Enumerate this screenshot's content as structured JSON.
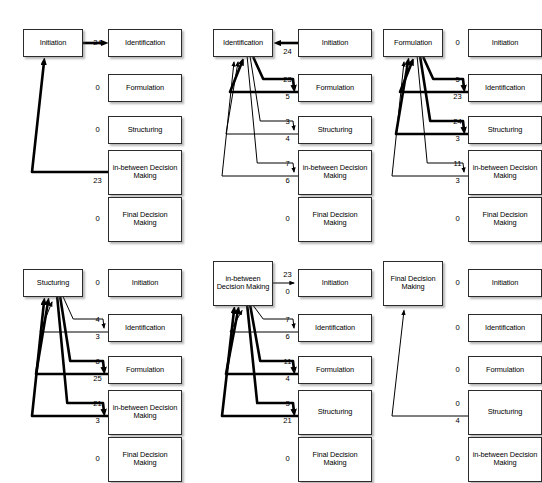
{
  "diagram": {
    "phase_labels": {
      "initiation": "Initiation",
      "identification": "Identification",
      "formulation": "Formulation",
      "structuring": "Structuring",
      "structuring_typo": "Stucturing",
      "inbetween": "in-between Decision Making",
      "final": "Final Decision Making"
    }
  },
  "panels": [
    {
      "id": "panel-initiation",
      "source": "Initiation",
      "rows": [
        {
          "target": "Identification",
          "out": "24",
          "in": null,
          "dir": "out",
          "weight": "thick"
        },
        {
          "target": "Formulation",
          "out": "0",
          "in": null,
          "dir": "none",
          "weight": "none"
        },
        {
          "target": "Structuring",
          "out": "0",
          "in": null,
          "dir": "none",
          "weight": "none"
        },
        {
          "target": "in-between Decision Making",
          "out": null,
          "in": "23",
          "dir": "in",
          "weight": "thick"
        },
        {
          "target": "Final Decision Making",
          "out": "0",
          "in": null,
          "dir": "none",
          "weight": "none"
        }
      ]
    },
    {
      "id": "panel-identification",
      "source": "Identification",
      "rows": [
        {
          "target": "Initiation",
          "out": null,
          "in": "24",
          "dir": "in",
          "weight": "thick"
        },
        {
          "target": "Formulation",
          "out": "23",
          "in": "5",
          "dir": "both",
          "weight": "thick"
        },
        {
          "target": "Structuring",
          "out": "3",
          "in": "4",
          "dir": "both",
          "weight": "thin"
        },
        {
          "target": "in-between Decision Making",
          "out": "7",
          "in": "6",
          "dir": "both",
          "weight": "thin"
        },
        {
          "target": "Final Decision Making",
          "out": "0",
          "in": null,
          "dir": "none",
          "weight": "none"
        }
      ]
    },
    {
      "id": "panel-formulation",
      "source": "Formulation",
      "rows": [
        {
          "target": "Initiation",
          "out": "0",
          "in": null,
          "dir": "none",
          "weight": "none"
        },
        {
          "target": "Identification",
          "out": "5",
          "in": "23",
          "dir": "both",
          "weight": "thick"
        },
        {
          "target": "Structuring",
          "out": "24",
          "in": "3",
          "dir": "both",
          "weight": "thick"
        },
        {
          "target": "in-between Decision Making",
          "out": "11",
          "in": "3",
          "dir": "both",
          "weight": "thin"
        },
        {
          "target": "Final Decision Making",
          "out": "0",
          "in": null,
          "dir": "none",
          "weight": "none"
        }
      ]
    },
    {
      "id": "panel-structuring",
      "source": "Stucturing",
      "rows": [
        {
          "target": "Initiation",
          "out": "0",
          "in": null,
          "dir": "none",
          "weight": "none"
        },
        {
          "target": "Identification",
          "out": "4",
          "in": "3",
          "dir": "both",
          "weight": "thin"
        },
        {
          "target": "Formulation",
          "out": "8",
          "in": "25",
          "dir": "both",
          "weight": "thick"
        },
        {
          "target": "in-between Decision Making",
          "out": "21",
          "in": "3",
          "dir": "both",
          "weight": "thick"
        },
        {
          "target": "Final Decision Making",
          "out": "0",
          "in": null,
          "dir": "none",
          "weight": "none"
        }
      ]
    },
    {
      "id": "panel-inbetween",
      "source": "in-between Decision Making",
      "rows": [
        {
          "target": "Initiation",
          "out": "23",
          "in": "0",
          "dir": "out",
          "weight": "thin"
        },
        {
          "target": "Identification",
          "out": "7",
          "in": "6",
          "dir": "both",
          "weight": "thin"
        },
        {
          "target": "Formulation",
          "out": "11",
          "in": "4",
          "dir": "both",
          "weight": "thick"
        },
        {
          "target": "Structuring",
          "out": "3",
          "in": "21",
          "dir": "both",
          "weight": "thick"
        },
        {
          "target": "Final Decision Making",
          "out": "0",
          "in": null,
          "dir": "none",
          "weight": "none"
        }
      ]
    },
    {
      "id": "panel-final",
      "source": "Final Decision Making",
      "rows": [
        {
          "target": "Initiation",
          "out": "0",
          "in": null,
          "dir": "none",
          "weight": "none"
        },
        {
          "target": "Identification",
          "out": "0",
          "in": null,
          "dir": "none",
          "weight": "none"
        },
        {
          "target": "Formulation",
          "out": "0",
          "in": null,
          "dir": "none",
          "weight": "none"
        },
        {
          "target": "Structuring",
          "out": "0",
          "in": "4",
          "dir": "in",
          "weight": "thin"
        },
        {
          "target": "in-between Decision Making",
          "out": "0",
          "in": null,
          "dir": "none",
          "weight": "none"
        }
      ]
    }
  ]
}
